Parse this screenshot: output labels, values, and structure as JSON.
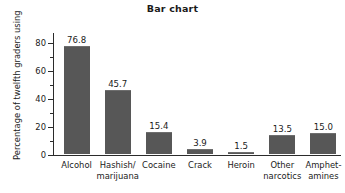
{
  "chart_data": {
    "type": "bar",
    "title": "Bar chart",
    "xlabel": "",
    "ylabel": "Percentage of twelfth graders using",
    "categories": [
      "Alcohol",
      "Hashish/\nmarijuana",
      "Cocaine",
      "Crack",
      "Heroin",
      "Other\nnarcotics",
      "Amphet-\namines"
    ],
    "values": [
      76.8,
      45.7,
      15.4,
      3.9,
      1.5,
      13.5,
      15.0
    ],
    "value_labels": [
      "76.8",
      "45.7",
      "15.4",
      "3.9",
      "1.5",
      "13.5",
      "15.0"
    ],
    "ylim": [
      0,
      87
    ],
    "yticks": [
      0,
      20,
      40,
      60,
      80
    ],
    "ytick_labels": [
      "0",
      "20",
      "40",
      "60",
      "80"
    ],
    "yminor_ticks": [
      10,
      30,
      50,
      70
    ],
    "grid": false,
    "legend": false,
    "bar_color": "#575757",
    "axis_color": "#2b2b2b",
    "text_color": "#1a1a1a",
    "background_color": "#ffffff"
  }
}
